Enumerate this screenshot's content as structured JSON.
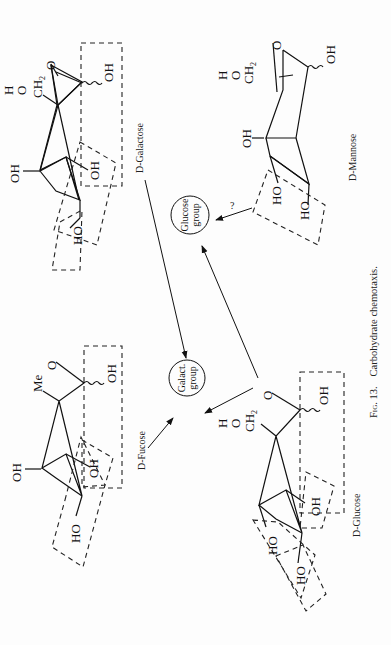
{
  "figure": {
    "caption_number": "Fig. 13.",
    "caption_text": "Carbohydrate chemotaxis.",
    "orientation": "rotated 90° counter-clockwise"
  },
  "molecules": {
    "galactose": {
      "name": "D-Galactose",
      "labels": {
        "h": "H",
        "o": "O",
        "ch2": "CH",
        "ch2_sub": "2",
        "ring_o": "O",
        "oh_anomeric": "OH",
        "oh_c4": "OH",
        "oh_c3": "OH",
        "ho_c2": "HO"
      }
    },
    "mannose": {
      "name": "D-Mannose",
      "labels": {
        "h": "H",
        "o": "O",
        "ch2": "CH",
        "ch2_sub": "2",
        "ring_o": "O",
        "oh_anomeric": "OH",
        "oh_c4": "OH",
        "ho_c3": "HO",
        "ho_c2": "HO"
      }
    },
    "fucose": {
      "name": "D-Fucose",
      "labels": {
        "me": "Me",
        "ring_o": "O",
        "oh_anomeric": "OH",
        "oh_c4": "OH",
        "oh_c3": "OH",
        "ho_c2": "HO"
      }
    },
    "glucose": {
      "name": "D-Glucose",
      "labels": {
        "h": "H",
        "o": "O",
        "ch2": "CH",
        "ch2_sub": "2",
        "ring_o": "O",
        "oh_anomeric": "OH",
        "oh_c2": "OH",
        "ho_c3": "HO",
        "ho_c4": "HO"
      }
    }
  },
  "receptors": {
    "galact_group": {
      "line1": "Galact.",
      "line2": "group"
    },
    "glucose_group": {
      "line1": "Glucose",
      "line2": "group"
    }
  },
  "annotations": {
    "question_mark": "?"
  }
}
